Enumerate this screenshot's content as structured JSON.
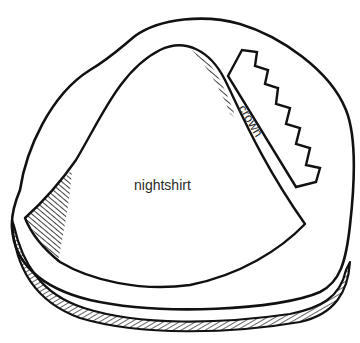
{
  "diagram": {
    "type": "illustration",
    "labels": {
      "main_piece": "nightshirt",
      "strip_piece": "crown"
    },
    "colors": {
      "stroke": "#111111",
      "background": "#ffffff",
      "text": "#2a2a2a"
    }
  }
}
